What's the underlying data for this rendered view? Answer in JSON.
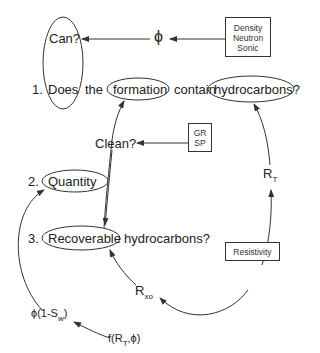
{
  "diagram": {
    "title_nodes": {
      "can": "Can?",
      "phi": "ϕ",
      "logs_porosity": [
        "Density",
        "Neutron",
        "Sonic"
      ]
    },
    "question1": {
      "number": "1.",
      "words": [
        "Does",
        "the",
        "formation",
        "contain",
        "hydrocarbons?"
      ]
    },
    "clean": {
      "label": "Clean?",
      "logs": [
        "GR",
        "SP"
      ]
    },
    "question2": {
      "number": "2.",
      "label": "Quantity"
    },
    "question3": {
      "number": "3.",
      "label": "Recoverable",
      "rest": "hydrocarbons?"
    },
    "resistivity": {
      "box": "Resistivity",
      "rt": {
        "main": "R",
        "sub": "T"
      },
      "rxo": {
        "main": "R",
        "sub": "xo"
      }
    },
    "saturation": {
      "hc_volume": {
        "prefix": "ϕ(1-S",
        "sub": "w",
        "suffix": ")"
      },
      "function": {
        "prefix": "f(R",
        "sub": "T",
        "suffix": ",ϕ)"
      }
    },
    "colors": {
      "line": "#333333",
      "text": "#222222",
      "background": "#ffffff"
    }
  }
}
